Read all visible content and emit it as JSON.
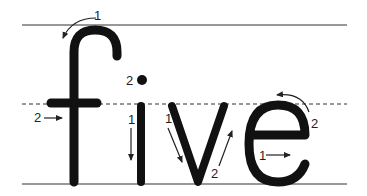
{
  "word": "five",
  "letters": [
    {
      "char": "f",
      "strokes": [
        {
          "number": "1",
          "direction": "counterclockwise curve then down"
        },
        {
          "number": "2",
          "direction": "left to right crossbar"
        }
      ]
    },
    {
      "char": "i",
      "strokes": [
        {
          "number": "1",
          "direction": "down"
        },
        {
          "number": "2",
          "direction": "dot"
        }
      ]
    },
    {
      "char": "v",
      "strokes": [
        {
          "number": "1",
          "direction": "slant down right"
        },
        {
          "number": "2",
          "direction": "slant up right"
        }
      ]
    },
    {
      "char": "e",
      "strokes": [
        {
          "number": "1",
          "direction": "left to right"
        },
        {
          "number": "2",
          "direction": "counterclockwise around"
        }
      ]
    }
  ],
  "labels": {
    "f1": "1",
    "f2": "2",
    "i1": "1",
    "i2": "2",
    "v1": "1",
    "v2": "2",
    "e1": "1",
    "e2": "2"
  },
  "guidelines": [
    "top-line",
    "midline-dashed",
    "baseline"
  ],
  "colors": {
    "ink": "#111111",
    "line": "#333333",
    "background": "#ffffff"
  }
}
